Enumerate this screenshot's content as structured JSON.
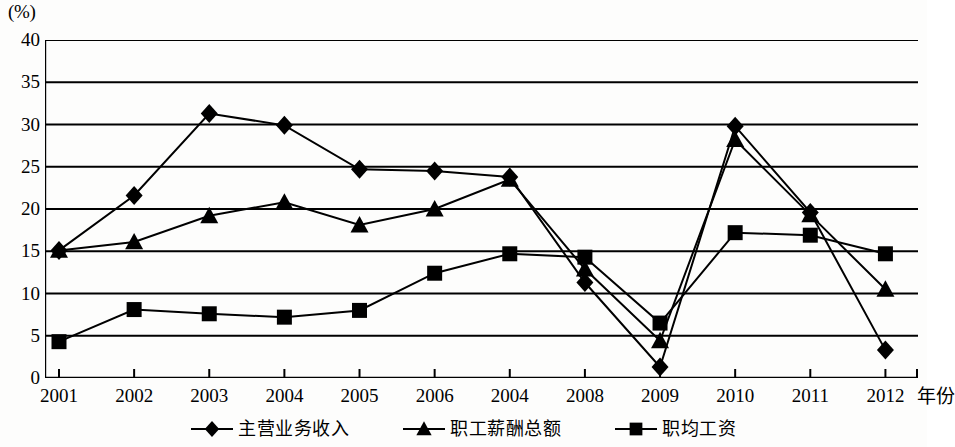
{
  "axis": {
    "unit_label": "(%)",
    "x_title": "年份",
    "y_ticks": [
      "40",
      "35",
      "30",
      "25",
      "20",
      "15",
      "10",
      "5",
      "0"
    ],
    "x_ticks": [
      "2001",
      "2002",
      "2003",
      "2004",
      "2005",
      "2006",
      "2004",
      "2008",
      "2009",
      "2010",
      "2011",
      "2012"
    ]
  },
  "legend": {
    "items": [
      {
        "label": "主营业务收入",
        "marker": "diamond-marker",
        "color": "#000000"
      },
      {
        "label": "职工薪酬总额",
        "marker": "triangle-marker",
        "color": "#000000"
      },
      {
        "label": "职均工资",
        "marker": "square-marker",
        "color": "#000000"
      }
    ]
  },
  "chart_data": {
    "type": "line",
    "title": "",
    "xlabel": "年份",
    "ylabel": "(%)",
    "categories": [
      "2001",
      "2002",
      "2003",
      "2004",
      "2005",
      "2006",
      "2004",
      "2008",
      "2009",
      "2010",
      "2011",
      "2012"
    ],
    "ylim": [
      0,
      40
    ],
    "xlim": [
      0,
      11
    ],
    "y_ticks": [
      0,
      5,
      10,
      15,
      20,
      25,
      30,
      35,
      40
    ],
    "grid": "horizontal",
    "legend_position": "bottom",
    "series": [
      {
        "name": "主营业务收入",
        "marker": "diamond",
        "color": "#000000",
        "values": [
          15.1,
          21.6,
          31.3,
          29.9,
          24.7,
          24.5,
          23.8,
          11.3,
          1.3,
          29.8,
          19.6,
          3.3
        ]
      },
      {
        "name": "职工薪酬总额",
        "marker": "triangle",
        "color": "#000000",
        "values": [
          15.1,
          16.1,
          19.2,
          20.8,
          18.1,
          20.0,
          23.5,
          12.9,
          4.4,
          28.2,
          19.3,
          10.5
        ]
      },
      {
        "name": "职均工资",
        "marker": "square",
        "color": "#000000",
        "values": [
          4.3,
          8.1,
          7.6,
          7.2,
          8.0,
          12.4,
          14.7,
          14.3,
          6.5,
          17.2,
          16.9,
          14.7
        ]
      }
    ]
  }
}
